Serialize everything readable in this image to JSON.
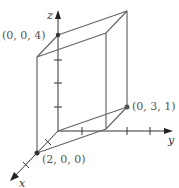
{
  "diagram": {
    "type": "3d-parallelepiped",
    "axes": {
      "x": {
        "label": "x"
      },
      "y": {
        "label": "y"
      },
      "z": {
        "label": "z"
      }
    },
    "points": [
      {
        "label": "(0, 0, 4)"
      },
      {
        "label": "(0, 3, 1)"
      },
      {
        "label": "(2, 0, 0)"
      }
    ],
    "colors": {
      "edge": "#666666",
      "axis": "#222222"
    }
  }
}
